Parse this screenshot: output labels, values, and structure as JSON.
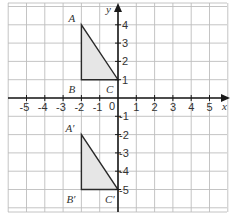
{
  "diagram": {
    "type": "coordinate-grid",
    "axes": {
      "x_label": "x",
      "y_label": "y",
      "origin_label": "0",
      "x_ticks": [
        "-5",
        "-4",
        "-3",
        "-2",
        "-1",
        "1",
        "2",
        "3",
        "4",
        "5"
      ],
      "y_ticks": [
        "4",
        "3",
        "2",
        "1",
        "-1",
        "-2",
        "-3",
        "-4",
        "-5"
      ]
    },
    "grid": {
      "x_min": -6,
      "x_max": 6,
      "y_min": -6,
      "y_max": 5.4
    },
    "shapes": [
      {
        "name": "triangle-ABC",
        "vertices": [
          {
            "label": "A",
            "x": -2,
            "y": 4
          },
          {
            "label": "B",
            "x": -2,
            "y": 1
          },
          {
            "label": "C",
            "x": 0,
            "y": 1
          }
        ]
      },
      {
        "name": "triangle-A'B'C'",
        "vertices": [
          {
            "label": "A′",
            "x": -2,
            "y": -2
          },
          {
            "label": "B′",
            "x": -2,
            "y": -5
          },
          {
            "label": "C′",
            "x": 0,
            "y": -5
          }
        ]
      }
    ],
    "colors": {
      "fill": "#e6e6e6",
      "stroke": "#2a2a2a",
      "grid": "#bdbdbd"
    }
  }
}
